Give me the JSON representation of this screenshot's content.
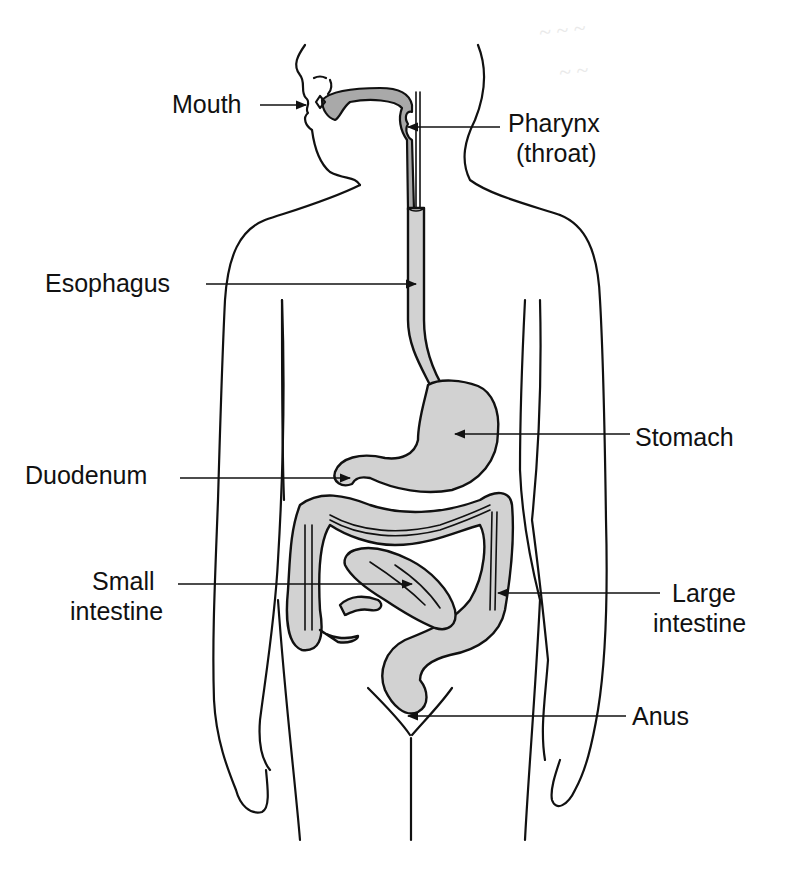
{
  "diagram": {
    "fill_color": "#d2d2d2",
    "pharynx_fill_color": "#a9a9a9",
    "line_color": "#111111",
    "labels": {
      "mouth": "Mouth",
      "pharynx_line1": "Pharynx",
      "pharynx_line2": "(throat)",
      "esophagus": "Esophagus",
      "stomach": "Stomach",
      "duodenum": "Duodenum",
      "small_intestine_line1": "Small",
      "small_intestine_line2": "intestine",
      "large_intestine_line1": "Large",
      "large_intestine_line2": "intestine",
      "anus": "Anus"
    }
  }
}
